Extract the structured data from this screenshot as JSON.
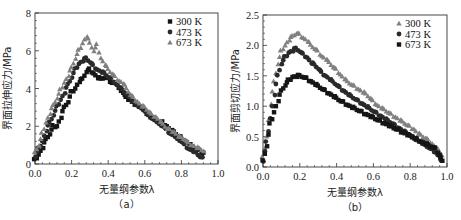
{
  "colors": {
    "black": "#151515",
    "dark": "#2a2a2a",
    "gray": "#808080",
    "axis": "#333333"
  },
  "chart_data": [
    {
      "id": "a",
      "type": "scatter",
      "title": "",
      "caption": "（a）",
      "xlabel": "无量纲参数λ",
      "ylabel": "界面拉伸应力/MPa",
      "xlim": [
        0,
        1.0
      ],
      "ylim": [
        0,
        8
      ],
      "xticks": [
        "0.0",
        "0.2",
        "0.4",
        "0.6",
        "0.8",
        "1.0"
      ],
      "yticks": [
        "0",
        "2",
        "4",
        "6",
        "8"
      ],
      "grid": false,
      "legend_position": "upper right",
      "frame": {
        "x0": 35,
        "x1": 218,
        "y0": 164,
        "y1": 13
      },
      "series": [
        {
          "name": "300 K",
          "marker": "square",
          "color": "#151515",
          "x": [
            0.0,
            0.02,
            0.04,
            0.06,
            0.08,
            0.1,
            0.12,
            0.14,
            0.16,
            0.18,
            0.2,
            0.22,
            0.24,
            0.26,
            0.28,
            0.3,
            0.32,
            0.34,
            0.36,
            0.38,
            0.4,
            0.42,
            0.44,
            0.46,
            0.48,
            0.5,
            0.52,
            0.54,
            0.56,
            0.58,
            0.6,
            0.62,
            0.64,
            0.66,
            0.68,
            0.7,
            0.72,
            0.74,
            0.76,
            0.78,
            0.8,
            0.82,
            0.84,
            0.86,
            0.88,
            0.9,
            0.92
          ],
          "y": [
            0.2,
            0.5,
            0.9,
            1.3,
            1.6,
            2.0,
            2.0,
            2.5,
            3.0,
            3.3,
            3.8,
            4.0,
            4.4,
            4.5,
            4.9,
            5.0,
            4.8,
            4.6,
            4.5,
            4.6,
            4.5,
            4.3,
            4.3,
            4.0,
            3.8,
            3.5,
            3.4,
            3.2,
            3.1,
            3.0,
            2.8,
            2.6,
            2.5,
            2.3,
            2.2,
            2.2,
            2.0,
            1.8,
            1.7,
            1.5,
            1.4,
            1.2,
            1.1,
            0.9,
            0.8,
            0.7,
            0.6
          ]
        },
        {
          "name": "473 K",
          "marker": "circle",
          "color": "#2a2a2a",
          "x": [
            0.0,
            0.02,
            0.04,
            0.06,
            0.08,
            0.1,
            0.12,
            0.14,
            0.16,
            0.18,
            0.2,
            0.22,
            0.24,
            0.26,
            0.28,
            0.3,
            0.32,
            0.34,
            0.36,
            0.38,
            0.4,
            0.42,
            0.44,
            0.46,
            0.48,
            0.5,
            0.52,
            0.54,
            0.56,
            0.58,
            0.6,
            0.62,
            0.64,
            0.66,
            0.68,
            0.7,
            0.72,
            0.74,
            0.76,
            0.78,
            0.8,
            0.82,
            0.84,
            0.86,
            0.88,
            0.9,
            0.92
          ],
          "y": [
            0.4,
            0.8,
            1.2,
            1.8,
            2.2,
            2.6,
            3.0,
            3.4,
            3.8,
            4.2,
            4.6,
            5.0,
            5.3,
            5.5,
            5.6,
            5.4,
            5.2,
            5.0,
            4.9,
            4.8,
            4.6,
            4.5,
            4.3,
            4.1,
            3.9,
            3.7,
            3.5,
            3.3,
            3.1,
            3.0,
            2.8,
            2.6,
            2.4,
            2.3,
            2.1,
            2.0,
            1.8,
            1.6,
            1.5,
            1.3,
            1.2,
            1.0,
            0.8,
            0.7,
            0.6,
            0.4,
            0.3
          ]
        },
        {
          "name": "673 K",
          "marker": "triangle",
          "color": "#808080",
          "x": [
            0.0,
            0.02,
            0.04,
            0.06,
            0.08,
            0.1,
            0.12,
            0.14,
            0.16,
            0.18,
            0.2,
            0.22,
            0.24,
            0.26,
            0.28,
            0.3,
            0.32,
            0.34,
            0.36,
            0.38,
            0.4,
            0.42,
            0.44,
            0.46,
            0.48,
            0.5,
            0.52,
            0.54,
            0.56,
            0.58,
            0.6,
            0.62,
            0.64,
            0.66,
            0.68,
            0.7,
            0.72,
            0.74,
            0.76,
            0.78,
            0.8,
            0.82,
            0.84,
            0.86,
            0.88,
            0.9,
            0.92
          ],
          "y": [
            0.6,
            1.0,
            1.6,
            2.2,
            2.7,
            3.1,
            3.5,
            3.9,
            4.3,
            4.7,
            5.1,
            5.6,
            6.0,
            6.4,
            6.8,
            6.4,
            6.0,
            6.3,
            5.6,
            5.3,
            5.0,
            4.8,
            4.6,
            4.4,
            4.3,
            4.0,
            3.7,
            3.5,
            3.3,
            3.1,
            3.0,
            2.8,
            2.6,
            2.5,
            2.3,
            2.1,
            1.9,
            1.8,
            1.7,
            1.5,
            1.4,
            1.3,
            1.1,
            1.0,
            0.9,
            0.8,
            0.7
          ]
        }
      ]
    },
    {
      "id": "b",
      "type": "scatter",
      "title": "",
      "caption": "（b）",
      "xlabel": "无量纲参数λ",
      "ylabel": "界面剪切应力/MPa",
      "xlim": [
        0,
        1.0
      ],
      "ylim": [
        0,
        2.5
      ],
      "xticks": [
        "0.0",
        "0.2",
        "0.4",
        "0.6",
        "0.8",
        "1.0"
      ],
      "yticks": [
        "0.0",
        "0.5",
        "1.0",
        "1.5",
        "2.0",
        "2.5"
      ],
      "grid": false,
      "legend_position": "upper right",
      "frame": {
        "x0": 263,
        "x1": 447,
        "y0": 167,
        "y1": 15
      },
      "series": [
        {
          "name": "300 K",
          "marker": "triangle",
          "color": "#808080",
          "x": [
            0.0,
            0.02,
            0.04,
            0.06,
            0.08,
            0.1,
            0.12,
            0.14,
            0.16,
            0.18,
            0.2,
            0.22,
            0.24,
            0.26,
            0.28,
            0.3,
            0.32,
            0.34,
            0.36,
            0.38,
            0.4,
            0.42,
            0.44,
            0.46,
            0.48,
            0.5,
            0.52,
            0.54,
            0.56,
            0.58,
            0.6,
            0.62,
            0.64,
            0.66,
            0.68,
            0.7,
            0.72,
            0.74,
            0.76,
            0.78,
            0.8,
            0.82,
            0.84,
            0.86,
            0.88,
            0.9,
            0.92,
            0.94,
            0.96,
            0.97
          ],
          "y": [
            0.15,
            0.5,
            1.05,
            1.4,
            1.7,
            1.9,
            2.0,
            2.1,
            2.15,
            2.2,
            2.18,
            2.12,
            2.08,
            2.0,
            1.95,
            1.9,
            1.82,
            1.78,
            1.72,
            1.65,
            1.6,
            1.52,
            1.46,
            1.4,
            1.36,
            1.32,
            1.28,
            1.24,
            1.2,
            1.14,
            1.08,
            1.02,
            0.98,
            0.94,
            0.9,
            0.86,
            0.82,
            0.78,
            0.74,
            0.7,
            0.66,
            0.62,
            0.56,
            0.52,
            0.48,
            0.44,
            0.38,
            0.32,
            0.25,
            0.2
          ]
        },
        {
          "name": "473 K",
          "marker": "circle",
          "color": "#2a2a2a",
          "x": [
            0.0,
            0.02,
            0.04,
            0.06,
            0.08,
            0.1,
            0.12,
            0.14,
            0.16,
            0.18,
            0.2,
            0.22,
            0.24,
            0.26,
            0.28,
            0.3,
            0.32,
            0.34,
            0.36,
            0.38,
            0.4,
            0.42,
            0.44,
            0.46,
            0.48,
            0.5,
            0.52,
            0.54,
            0.56,
            0.58,
            0.6,
            0.62,
            0.64,
            0.66,
            0.68,
            0.7,
            0.72,
            0.74,
            0.76,
            0.78,
            0.8,
            0.82,
            0.84,
            0.86,
            0.88,
            0.9,
            0.92,
            0.94,
            0.96,
            0.97
          ],
          "y": [
            0.1,
            0.4,
            0.8,
            1.2,
            1.5,
            1.7,
            1.8,
            1.88,
            1.92,
            1.95,
            1.9,
            1.85,
            1.8,
            1.72,
            1.68,
            1.62,
            1.55,
            1.5,
            1.45,
            1.4,
            1.35,
            1.3,
            1.25,
            1.2,
            1.16,
            1.12,
            1.08,
            1.04,
            1.0,
            0.96,
            0.92,
            0.88,
            0.84,
            0.8,
            0.76,
            0.72,
            0.68,
            0.64,
            0.6,
            0.56,
            0.52,
            0.48,
            0.44,
            0.4,
            0.36,
            0.32,
            0.28,
            0.24,
            0.15,
            0.1
          ]
        },
        {
          "name": "673 K",
          "marker": "square",
          "color": "#151515",
          "x": [
            0.0,
            0.02,
            0.04,
            0.06,
            0.08,
            0.1,
            0.12,
            0.14,
            0.16,
            0.18,
            0.2,
            0.22,
            0.24,
            0.26,
            0.28,
            0.3,
            0.32,
            0.34,
            0.36,
            0.38,
            0.4,
            0.42,
            0.44,
            0.46,
            0.48,
            0.5,
            0.52,
            0.54,
            0.56,
            0.58,
            0.6,
            0.62,
            0.64,
            0.66,
            0.68,
            0.7,
            0.72,
            0.74,
            0.76,
            0.78,
            0.8,
            0.82,
            0.84,
            0.86,
            0.88,
            0.9,
            0.92,
            0.94,
            0.96,
            0.97
          ],
          "y": [
            0.1,
            0.35,
            0.7,
            0.9,
            1.1,
            1.25,
            1.35,
            1.42,
            1.48,
            1.5,
            1.5,
            1.48,
            1.45,
            1.41,
            1.37,
            1.33,
            1.29,
            1.25,
            1.21,
            1.17,
            1.13,
            1.09,
            1.06,
            1.02,
            0.99,
            0.96,
            0.93,
            0.9,
            0.87,
            0.84,
            0.81,
            0.78,
            0.75,
            0.72,
            0.69,
            0.66,
            0.63,
            0.6,
            0.57,
            0.54,
            0.51,
            0.48,
            0.45,
            0.42,
            0.39,
            0.36,
            0.33,
            0.3,
            0.2,
            0.12
          ]
        }
      ]
    }
  ]
}
